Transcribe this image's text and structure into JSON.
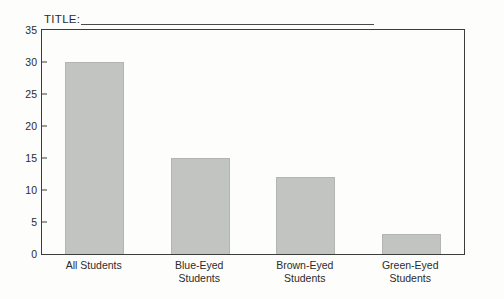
{
  "worksheet": {
    "title_label": "TITLE:",
    "title_value": ""
  },
  "chart_data": {
    "type": "bar",
    "title": "",
    "xlabel": "",
    "ylabel": "",
    "ylim": [
      0,
      35
    ],
    "yticks": [
      0,
      5,
      10,
      15,
      20,
      25,
      30,
      35
    ],
    "grid": false,
    "legend": false,
    "bar_color": "#c2c4c1",
    "axis_color": "#3c3c3c",
    "categories": [
      "All Students",
      "Blue-Eyed\nStudents",
      "Brown-Eyed\nStudents",
      "Green-Eyed\nStudents"
    ],
    "values": [
      30,
      15,
      12,
      3.2
    ]
  }
}
